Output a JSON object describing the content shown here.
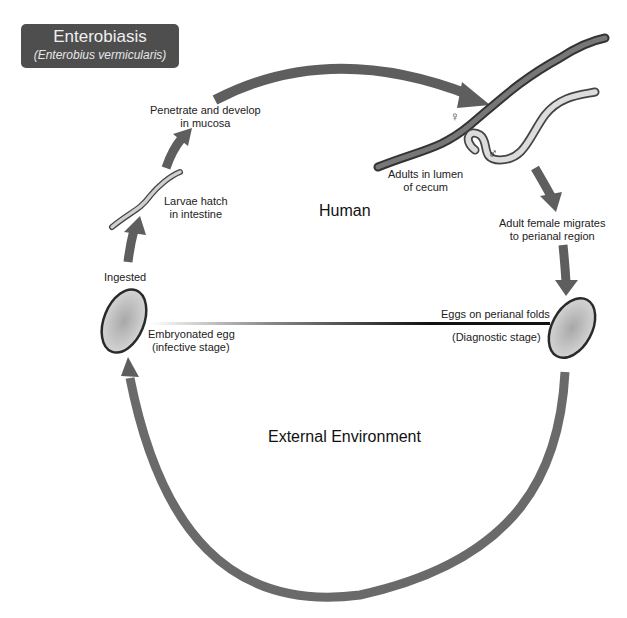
{
  "title": {
    "main": "Enterobiasis",
    "subtitle": "(Enterobius vermicularis)"
  },
  "regions": {
    "human": "Human",
    "external": "External Environment"
  },
  "stages": {
    "penetrate": [
      "Penetrate and develop",
      "in mucosa"
    ],
    "larvae": [
      "Larvae hatch",
      "in intestine"
    ],
    "ingested": "Ingested",
    "adults": [
      "Adults in lumen",
      "of cecum"
    ],
    "migrate": [
      "Adult female migrates",
      "to perianal region"
    ],
    "eggs_perianal": "Eggs on perianal folds",
    "diagnostic": "(Diagnostic stage)",
    "embryonated": [
      "Embryonated egg",
      "(infective stage)"
    ]
  },
  "symbols": {
    "female": "♀",
    "male": "♂"
  },
  "colors": {
    "title_bg": "#4e4e4e",
    "arrow": "#5e5e5e",
    "egg_fill": "#c9c9c9",
    "female_worm": "#555555",
    "male_worm": "#d0d0d0"
  }
}
